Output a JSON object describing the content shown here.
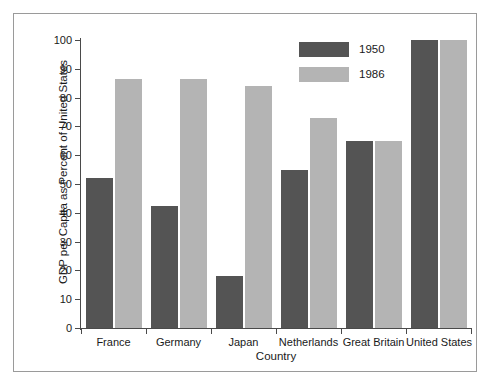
{
  "chart_data": {
    "type": "bar",
    "title": "",
    "xlabel": "Country",
    "ylabel": "GDP per Capita as Percent of United States",
    "categories": [
      "France",
      "Germany",
      "Japan",
      "Netherlands",
      "Great Britain",
      "United States"
    ],
    "series": [
      {
        "name": "1950",
        "color": "#545454",
        "values": [
          52,
          42.5,
          18,
          55,
          65,
          100
        ]
      },
      {
        "name": "1986",
        "color": "#b4b4b4",
        "values": [
          86.5,
          86.5,
          84,
          73,
          65,
          100
        ]
      }
    ],
    "ylim": [
      0,
      100
    ],
    "ytick_labels": [
      "0",
      "10",
      "20",
      "30",
      "40",
      "50",
      "60",
      "70",
      "80",
      "90",
      "100"
    ],
    "ytick_values": [
      0,
      10,
      20,
      30,
      40,
      50,
      60,
      70,
      80,
      90,
      100
    ],
    "grid": false,
    "legend_position": "top-right-inside"
  },
  "legend": {
    "entries": [
      {
        "label": "1950",
        "color": "#545454"
      },
      {
        "label": "1986",
        "color": "#b4b4b4"
      }
    ]
  },
  "figure": {
    "border_color": "#9a9a9a",
    "background": "#ffffff",
    "axis_color": "#4a4a4a"
  }
}
